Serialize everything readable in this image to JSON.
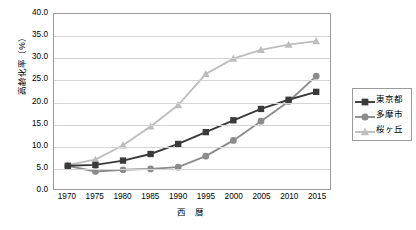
{
  "chart_data": {
    "type": "line",
    "title": "",
    "xlabel": "西 暦",
    "ylabel": "高齢化率（%）",
    "categories": [
      "1970",
      "1975",
      "1980",
      "1985",
      "1990",
      "1995",
      "2000",
      "2005",
      "2010",
      "2015"
    ],
    "x": [
      1970,
      1975,
      1980,
      1985,
      1990,
      1995,
      2000,
      2005,
      2010,
      2015
    ],
    "ylim": [
      0.0,
      40.0
    ],
    "yticks": [
      "0.0",
      "5.0",
      "10.0",
      "15.0",
      "20.0",
      "25.0",
      "30.0",
      "35.0",
      "40.0"
    ],
    "ytick_values": [
      0.0,
      5.0,
      10.0,
      15.0,
      20.0,
      25.0,
      30.0,
      35.0,
      40.0
    ],
    "grid": "horizontal",
    "legend_position": "right",
    "series": [
      {
        "name": "東京都",
        "marker": "square",
        "color": "#3a3a3a",
        "values": [
          5.3,
          5.5,
          6.5,
          8.0,
          10.3,
          13.0,
          15.7,
          18.3,
          20.4,
          22.2
        ]
      },
      {
        "name": "多摩市",
        "marker": "circle",
        "color": "#8c8c8c",
        "values": [
          5.3,
          4.0,
          4.4,
          4.6,
          5.0,
          7.5,
          11.1,
          15.5,
          20.0,
          25.8
        ]
      },
      {
        "name": "桜ヶ丘",
        "marker": "triangle",
        "color": "#bdbdbd",
        "values": [
          5.5,
          6.7,
          10.0,
          14.3,
          19.2,
          26.3,
          29.8,
          31.8,
          33.0,
          33.8
        ]
      }
    ]
  },
  "legend": {
    "items": [
      {
        "label": "東京都",
        "marker": "square",
        "color": "#3a3a3a"
      },
      {
        "label": "多摩市",
        "marker": "circle",
        "color": "#8c8c8c"
      },
      {
        "label": "桜ヶ丘",
        "marker": "triangle",
        "color": "#bdbdbd"
      }
    ]
  },
  "axes": {
    "y_title": "高齢化率（%）",
    "x_title": "西 暦"
  },
  "colors": {
    "plot_border": "#9a9a9a",
    "gridline": "#d4d4d4",
    "background": "#ffffff"
  }
}
